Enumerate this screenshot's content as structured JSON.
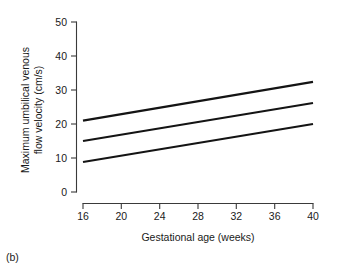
{
  "figure": {
    "panel_caption": "(b)",
    "background_color": "#ffffff",
    "line_color": "#141414",
    "axis_color": "#3a3a3a"
  },
  "chart_data": {
    "type": "line",
    "title": "",
    "xlabel": "Gestational age (weeks)",
    "ylabel": "Maximum umbilical venous flow velocity (cm/s)",
    "ylabel_lines": [
      "Maximum umbilical venous",
      "flow velocity (cm/s)"
    ],
    "xlim": [
      16,
      40
    ],
    "ylim": [
      0,
      50
    ],
    "xticks": [
      16,
      20,
      24,
      28,
      32,
      36,
      40
    ],
    "xtick_labels": [
      "16",
      "20",
      "24",
      "28",
      "32",
      "36",
      "40"
    ],
    "yticks": [
      0,
      10,
      20,
      30,
      40,
      50
    ],
    "ytick_labels": [
      "0",
      "10",
      "20",
      "30",
      "40",
      "50"
    ],
    "grid": false,
    "legend": null,
    "x": [
      16,
      40
    ],
    "series": [
      {
        "name": "upper reference line",
        "values": [
          21.0,
          32.4
        ]
      },
      {
        "name": "median reference line",
        "values": [
          15.0,
          26.2
        ]
      },
      {
        "name": "lower reference line",
        "values": [
          8.8,
          20.0
        ]
      }
    ]
  }
}
